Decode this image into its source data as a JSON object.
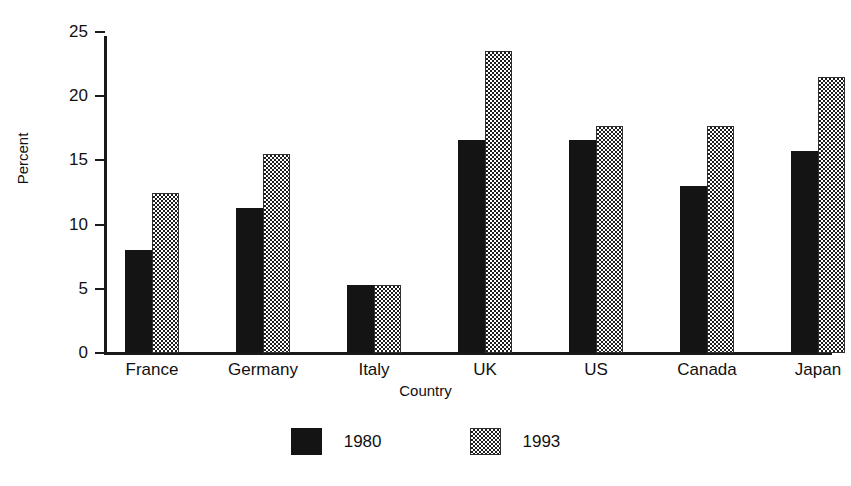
{
  "chart_data": {
    "type": "bar",
    "title": "",
    "xlabel": "Country",
    "ylabel": "Percent",
    "categories": [
      "France",
      "Germany",
      "Italy",
      "UK",
      "US",
      "Canada",
      "Japan"
    ],
    "series": [
      {
        "name": "1980",
        "values": [
          8.0,
          11.3,
          5.3,
          16.6,
          16.6,
          13.0,
          15.7
        ],
        "fill": "solid-black"
      },
      {
        "name": "1993",
        "values": [
          12.5,
          15.5,
          5.3,
          23.5,
          17.7,
          17.7,
          21.5
        ],
        "fill": "checkered"
      }
    ],
    "ylim": [
      0,
      25
    ],
    "yticks": [
      0,
      5,
      10,
      15,
      20,
      25
    ],
    "ytick_labels": [
      "0",
      "5",
      "10",
      "15",
      "20",
      "25"
    ],
    "grid": false,
    "legend_position": "bottom-center",
    "colors": {
      "series_1980": "#141414",
      "series_1993": "#1d1d1d",
      "axis": "#1a1a1a",
      "background": "#ffffff",
      "text": "#111111"
    }
  }
}
